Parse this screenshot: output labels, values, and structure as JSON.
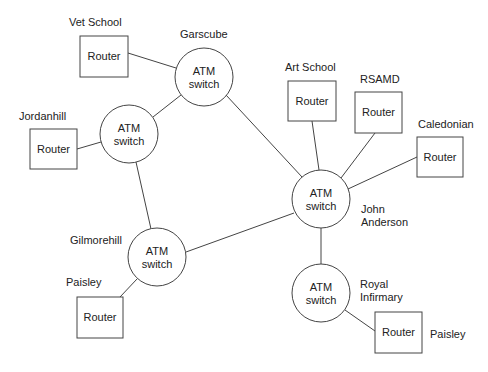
{
  "diagram": {
    "type": "network-topology",
    "switches": [
      {
        "id": "garscube",
        "label_line1": "ATM",
        "label_line2": "switch",
        "site": "Garscube",
        "cx": 204,
        "cy": 77
      },
      {
        "id": "jordanhill",
        "label_line1": "ATM",
        "label_line2": "switch",
        "site": "",
        "cx": 129,
        "cy": 134
      },
      {
        "id": "john-anderson",
        "label_line1": "ATM",
        "label_line2": "switch",
        "site": "John Anderson",
        "cx": 321,
        "cy": 199
      },
      {
        "id": "gilmorehill",
        "label_line1": "ATM",
        "label_line2": "switch",
        "site": "Gilmorehill",
        "cx": 157,
        "cy": 257
      },
      {
        "id": "royal-infirmary",
        "label_line1": "ATM",
        "label_line2": "switch",
        "site": "Royal Infirmary",
        "cx": 321,
        "cy": 293
      }
    ],
    "routers": [
      {
        "id": "vet-school",
        "label": "Router",
        "site": "Vet School"
      },
      {
        "id": "jordanhill",
        "label": "Router",
        "site": "Jordanhill"
      },
      {
        "id": "art-school",
        "label": "Router",
        "site": "Art School"
      },
      {
        "id": "rsamd",
        "label": "Router",
        "site": "RSAMD"
      },
      {
        "id": "caledonian",
        "label": "Router",
        "site": "Caledonian"
      },
      {
        "id": "paisley-gilmorehill",
        "label": "Router",
        "site": "Paisley"
      },
      {
        "id": "paisley-royal",
        "label": "Router",
        "site": "Paisley"
      }
    ],
    "site_labels": {
      "vet_school": "Vet School",
      "garscube": "Garscube",
      "jordanhill": "Jordanhill",
      "art_school": "Art School",
      "rsamd": "RSAMD",
      "caledonian": "Caledonian",
      "john_anderson_1": "John",
      "john_anderson_2": "Anderson",
      "gilmorehill": "Gilmorehill",
      "paisley_left": "Paisley",
      "royal_1": "Royal",
      "royal_2": "Infirmary",
      "paisley_right": "Paisley"
    },
    "links": [
      [
        "vet-school-router",
        "garscube-switch"
      ],
      [
        "garscube-switch",
        "jordanhill-switch"
      ],
      [
        "garscube-switch",
        "john-anderson-switch"
      ],
      [
        "jordanhill-router",
        "jordanhill-switch"
      ],
      [
        "jordanhill-switch",
        "gilmorehill-switch"
      ],
      [
        "gilmorehill-switch",
        "john-anderson-switch"
      ],
      [
        "gilmorehill-switch",
        "paisley-router-left"
      ],
      [
        "art-school-router",
        "john-anderson-switch"
      ],
      [
        "rsamd-router",
        "john-anderson-switch"
      ],
      [
        "caledonian-router",
        "john-anderson-switch"
      ],
      [
        "john-anderson-switch",
        "royal-infirmary-switch"
      ],
      [
        "royal-infirmary-switch",
        "paisley-router-right"
      ]
    ]
  }
}
